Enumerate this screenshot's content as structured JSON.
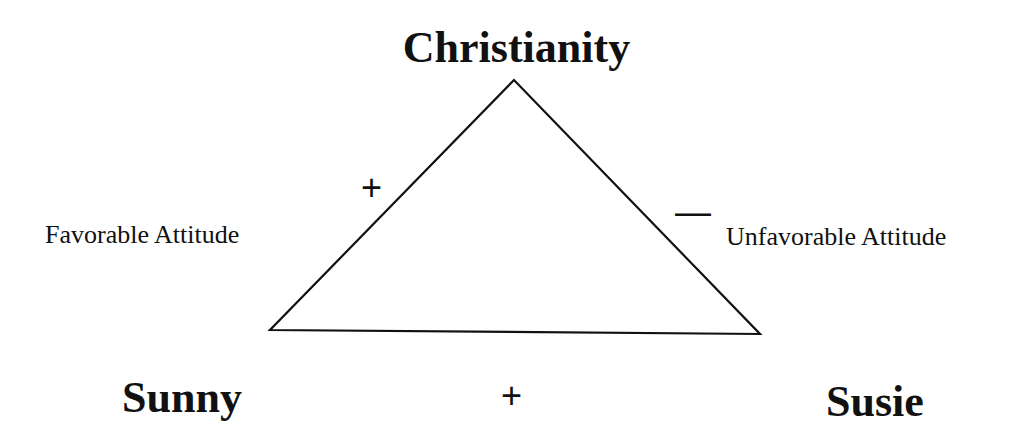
{
  "diagram": {
    "type": "balance-theory-triangle",
    "nodes": {
      "top": "Christianity",
      "bottom_left": "Sunny",
      "bottom_right": "Susie"
    },
    "edges": {
      "left": {
        "sign": "+",
        "label": "Favorable Attitude"
      },
      "right": {
        "sign": "—",
        "label": "Unfavorable Attitude"
      },
      "bottom": {
        "sign": "+"
      }
    },
    "colors": {
      "line": "#111111",
      "background": "#ffffff"
    }
  }
}
